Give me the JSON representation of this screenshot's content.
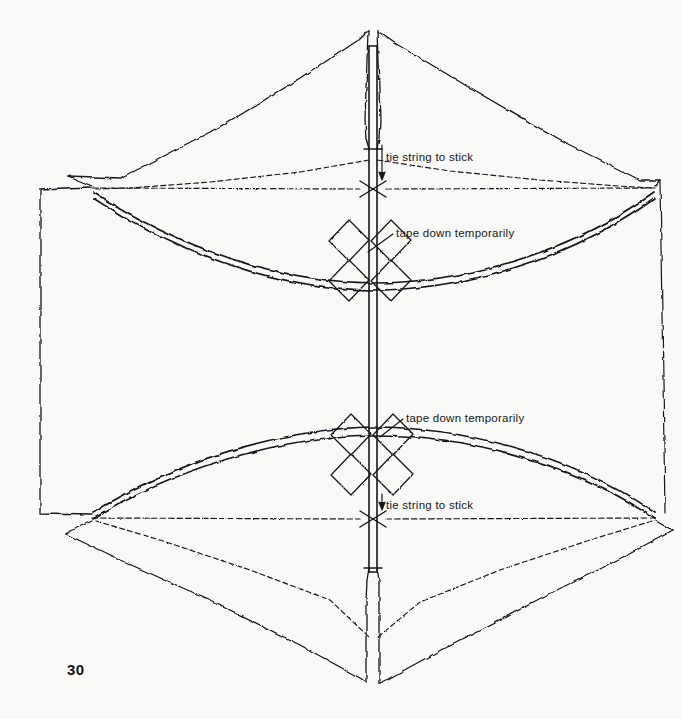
{
  "page": {
    "number": "30",
    "background_color": "#f9f9f8",
    "ink_color": "#17171a",
    "width": 681,
    "height": 719
  },
  "annotations": [
    {
      "id": "tie-string-top",
      "text": "tie string to stick",
      "x": 386,
      "y": 152,
      "target": "upper spine-to-string knot"
    },
    {
      "id": "tape-down-top",
      "text": "tape down temporarily",
      "x": 396,
      "y": 228,
      "target": "upper spar crossing tape"
    },
    {
      "id": "tape-down-bottom",
      "text": "tape down temporarily",
      "x": 406,
      "y": 413,
      "target": "lower spar crossing tape"
    },
    {
      "id": "tie-string-bottom",
      "text": "tie string to stick",
      "x": 386,
      "y": 500,
      "target": "lower spine-to-string knot"
    }
  ],
  "figure": {
    "parts": [
      {
        "name": "spine-stick",
        "type": "vertical double-line stick",
        "notes": "runs full height, notched into sail slots at top and bottom"
      },
      {
        "name": "upper-sail-panel",
        "type": "paper panel",
        "notes": "peaked panel above upper string line, split by a notch at the peak"
      },
      {
        "name": "lower-sail-panel",
        "type": "paper panel",
        "notes": "peaked panel below lower string line, split by a notch at the base"
      },
      {
        "name": "left-side-flap",
        "type": "rectangular fold flap",
        "notes": "solid rectangle on the left edge with vertical dashed fold line"
      },
      {
        "name": "right-side-flap",
        "type": "rectangular fold flap",
        "notes": "vertical dashed fold line near the right edge"
      },
      {
        "name": "upper-bow-spar",
        "type": "bowed spar",
        "notes": "sags downward between upper left and right corner junctions"
      },
      {
        "name": "lower-bow-spar",
        "type": "bowed spar",
        "notes": "arches upward between lower left and right corner junctions"
      },
      {
        "name": "upper-string-line",
        "type": "dashed string",
        "notes": "horizontal dashed line across the upper corners"
      },
      {
        "name": "lower-string-line",
        "type": "dashed string",
        "notes": "horizontal dashed line across the lower corners"
      },
      {
        "name": "upper-tape-cross",
        "type": "four taped squares",
        "notes": "four diamonds around the upper spar/spine crossing"
      },
      {
        "name": "lower-tape-cross",
        "type": "four taped squares",
        "notes": "four diamonds around the lower spar/spine crossing"
      },
      {
        "name": "upper-knot",
        "type": "string knot",
        "notes": "X-shaped knot where the upper string crosses the spine"
      },
      {
        "name": "lower-knot",
        "type": "string knot",
        "notes": "X-shaped knot where the lower string crosses the spine"
      }
    ]
  }
}
